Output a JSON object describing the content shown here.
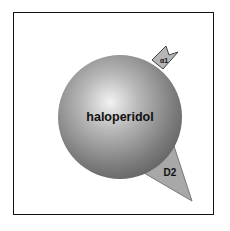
{
  "diagram": {
    "molecule": {
      "label": "haloperidol",
      "shape": "sphere",
      "color_center": "#e8e8e8",
      "color_edge": "#6a6a6a"
    },
    "receptors": [
      {
        "id": "alpha1",
        "label": "α1",
        "shape": "notch",
        "color": "#b0b0b0"
      },
      {
        "id": "d2",
        "label": "D2",
        "shape": "triangle",
        "color": "#a8a8a8"
      }
    ],
    "frame_color": "#111111"
  }
}
